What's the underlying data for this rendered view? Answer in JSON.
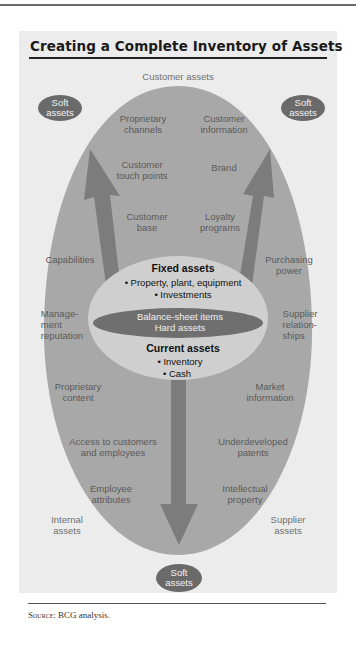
{
  "figure": {
    "title": "Creating a Complete Inventory of Assets",
    "source_prefix": "Source:",
    "source_text": "BCG analysis."
  },
  "quadrants": {
    "customer_assets": "Customer assets",
    "internal_assets_line1": "Internal",
    "internal_assets_line2": "assets",
    "supplier_assets_line1": "Supplier",
    "supplier_assets_line2": "assets"
  },
  "soft_assets": {
    "line1": "Soft",
    "line2": "assets"
  },
  "outer_items": {
    "proprietary_channels": [
      "Proprietary",
      "channels"
    ],
    "customer_information": [
      "Customer",
      "information"
    ],
    "customer_touch_points": [
      "Customer",
      "touch points"
    ],
    "brand": [
      "Brand"
    ],
    "customer_base": [
      "Customer",
      "base"
    ],
    "loyalty_programs": [
      "Loyalty",
      "programs"
    ],
    "capabilities": [
      "Capabilities"
    ],
    "purchasing_power": [
      "Purchasing",
      "power"
    ],
    "management_reputation": [
      "Manage-",
      "ment",
      "reputation"
    ],
    "supplier_relationships": [
      "Supplier",
      "relation-",
      "ships"
    ],
    "proprietary_content": [
      "Proprietary",
      "content"
    ],
    "market_information": [
      "Market",
      "information"
    ],
    "access_customers_employees": [
      "Access to customers",
      "and employees"
    ],
    "underdeveloped_patents": [
      "Underdeveloped",
      "patents"
    ],
    "employee_attributes": [
      "Employee",
      "attributes"
    ],
    "intellectual_property": [
      "Intellectual",
      "property"
    ]
  },
  "core": {
    "fixed_title": "Fixed assets",
    "fixed_items": [
      "• Property, plant, equipment",
      "• Investments"
    ],
    "balance_line1": "Balance-sheet items",
    "balance_line2": "Hard assets",
    "current_title": "Current assets",
    "current_items": [
      "• Inventory",
      "• Cash"
    ]
  },
  "colors": {
    "panel": "#ececec",
    "outer_oval": "#a8a8a8",
    "arrow": "#7c7c7c",
    "inner_oval": "#cfcfcf",
    "dark_oval": "#6f6f6f",
    "soft_pill": "#6a6a6a"
  }
}
